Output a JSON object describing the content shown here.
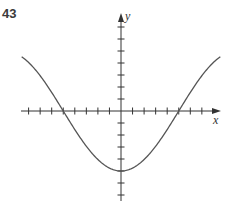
{
  "problem_number": "43",
  "axes": {
    "x_label": "x",
    "y_label": "y"
  },
  "colors": {
    "axis": "#333333",
    "curve": "#555555"
  },
  "chart_data": {
    "type": "line",
    "title": "",
    "xlabel": "x",
    "ylabel": "y",
    "function": "y = -5 cos(pi x / 10)",
    "x_ticks_unlabeled": true,
    "xlim": [
      -8.6,
      8.6
    ],
    "ylim": [
      -7,
      8
    ],
    "x_intercepts": [
      -5,
      5
    ],
    "minimum": {
      "x": 0,
      "y": -5
    },
    "endpoints": [
      {
        "x": -8.6,
        "y": 4.5
      },
      {
        "x": 8.6,
        "y": 4.5
      }
    ],
    "grid": false,
    "legend": null
  }
}
